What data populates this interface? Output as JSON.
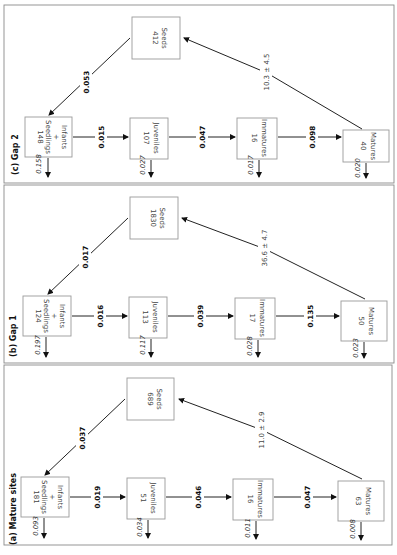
{
  "figure": {
    "orientation": "rotated 90 degrees clockwise",
    "panels": [
      {
        "id": "c",
        "title": "(c) Gap 2",
        "nodes": {
          "seeds": {
            "count": "412",
            "label": "Seeds"
          },
          "seedlings": {
            "count": "148",
            "label1": "Seedlings",
            "plus": "+",
            "label2": "Infants"
          },
          "juveniles": {
            "count": "107",
            "label": "Juveniles"
          },
          "immatures": {
            "count": "16",
            "label": "Immatures"
          },
          "matures": {
            "count": "40",
            "label": "Matures"
          }
        },
        "transitions": {
          "seeds_to_seedlings": "0.053",
          "seedlings_to_juveniles": "0.015",
          "juveniles_to_immatures": "0.047",
          "immatures_to_matures": "0.098",
          "fecundity": "10.3 ± 4.5"
        },
        "mortality": {
          "seedlings": "0.158",
          "juveniles": "0.027",
          "immatures": "0.017",
          "matures": "0.020"
        }
      },
      {
        "id": "b",
        "title": "(b) Gap 1",
        "nodes": {
          "seeds": {
            "count": "1830",
            "label": "Seeds"
          },
          "seedlings": {
            "count": "124",
            "label1": "Seedlings",
            "plus": "+",
            "label2": "Infants"
          },
          "juveniles": {
            "count": "113",
            "label": "Juveniles"
          },
          "immatures": {
            "count": "17",
            "label": "Immatures"
          },
          "matures": {
            "count": "50",
            "label": "Matures"
          }
        },
        "transitions": {
          "seeds_to_seedlings": "0.017",
          "seedlings_to_juveniles": "0.016",
          "juveniles_to_immatures": "0.039",
          "immatures_to_matures": "0.135",
          "fecundity": "36.6 ± 4.7"
        },
        "mortality": {
          "seedlings": "0.197",
          "juveniles": "0.117",
          "immatures": "0.028",
          "matures": "0.023"
        }
      },
      {
        "id": "a",
        "title": "(a) Mature sites",
        "nodes": {
          "seeds": {
            "count": "689",
            "label": "Seeds"
          },
          "seedlings": {
            "count": "181",
            "label1": "Seedlings",
            "plus": "+",
            "label2": "Infants"
          },
          "juveniles": {
            "count": "51",
            "label": "Juveniles"
          },
          "immatures": {
            "count": "16",
            "label": "Immatures"
          },
          "matures": {
            "count": "63",
            "label": "Matures"
          }
        },
        "transitions": {
          "seeds_to_seedlings": "0.037",
          "seedlings_to_juveniles": "0.019",
          "juveniles_to_immatures": "0.046",
          "immatures_to_matures": "0.047",
          "fecundity": "11.0 ± 2.9"
        },
        "mortality": {
          "seedlings": "0.093",
          "juveniles": "0.034",
          "immatures": "0.011",
          "matures": "0.008"
        }
      }
    ]
  }
}
